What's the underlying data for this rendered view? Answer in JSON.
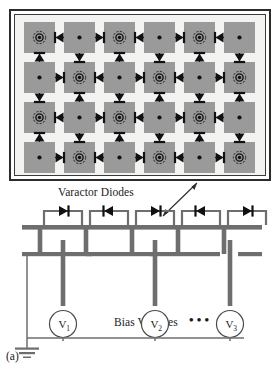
{
  "figure": {
    "caption": "(a)",
    "array": {
      "rows": 4,
      "cols": 6,
      "patch_color": "#9a9a9a",
      "background_color": "#f3f3f1",
      "border_color": "#2b2b2b",
      "ring_pattern": "checkerboard",
      "ring_rows": [
        [
          true,
          false,
          true,
          false,
          true,
          false
        ],
        [
          false,
          true,
          false,
          true,
          false,
          true
        ],
        [
          true,
          false,
          true,
          false,
          true,
          false
        ],
        [
          false,
          true,
          false,
          true,
          false,
          true
        ]
      ]
    },
    "labels": {
      "varactor_diodes": "Varactor Diodes",
      "bias_voltages": "Bias Voltages"
    },
    "circuit": {
      "voltage_sources": [
        {
          "symbol": "V",
          "subscript": "1"
        },
        {
          "symbol": "V",
          "subscript": "2"
        },
        {
          "symbol": "V",
          "subscript": "3"
        }
      ],
      "ellipsis": "• • •",
      "diode_count": 5,
      "ground_symbol": "earth-ground",
      "line_color": "#6e6e6e",
      "ink_color": "#2b2b2b"
    }
  }
}
